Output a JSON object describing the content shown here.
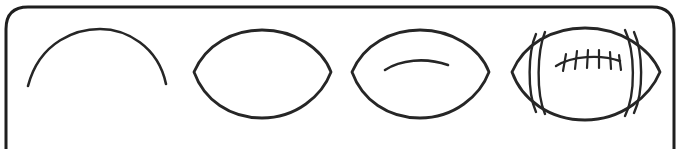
{
  "canvas": {
    "width": 681,
    "height": 149,
    "background_color": "#ffffff",
    "ink_color": "#262626",
    "frame_color": "#1f1f1f",
    "title": "How to draw a football - 4 step sequence"
  },
  "frame": {
    "shape": "rounded-rectangle",
    "corner_radius": 22,
    "stroke_width": 3,
    "x": 6,
    "y": 7,
    "width": 668,
    "height": 160,
    "note": "bottom edge cropped off below the visible canvas"
  },
  "steps": [
    {
      "index": 1,
      "name": "top-arc",
      "description": "single upward arc forming the top half of the football outline",
      "stroke_width": 2.6,
      "paths": [
        "M 28 86 C 40 40, 78 29, 100 29 C 126 29, 158 46, 166 84"
      ]
    },
    {
      "index": 2,
      "name": "lens-outline",
      "description": "closed lens (pointed oval) shape - the complete football outline",
      "stroke_width": 2.8,
      "paths": [
        "M 194 72 C 206 44, 234 30, 262 30 C 294 30, 322 48, 331 72 C 322 96, 296 118, 262 118 C 230 118, 204 100, 194 72 Z"
      ]
    },
    {
      "index": 3,
      "name": "lens-with-lace-line",
      "description": "lens outline plus a shallow inner arc marking the lace line",
      "stroke_width": 2.8,
      "paths": [
        "M 352 72 C 364 44, 392 30, 420 30 C 452 30, 480 48, 489 72 C 480 96, 454 118, 420 118 C 388 118, 362 100, 352 72 Z"
      ],
      "detail_paths": [
        "M 385 70 C 400 60, 425 57, 448 65"
      ]
    },
    {
      "index": 4,
      "name": "finished-football",
      "description": "finished football with two end stripe bands and laces with stitches",
      "stroke_width": 2.8,
      "paths": [
        "M 512 72 C 524 44, 552 28, 585 28 C 620 28, 650 48, 660 72 C 650 96, 622 120, 585 120 C 550 120, 522 100, 512 72 Z"
      ],
      "stripe_paths": [
        "M 536 34 C 528 52, 527 92, 536 112",
        "M 545 32 C 537 52, 536 93, 545 114",
        "M 634 32 C 643 52, 644 92, 634 113",
        "M 625 30 C 635 51, 636 94, 625 116"
      ],
      "lace_line_path": "M 556 66 C 572 56, 600 54, 620 61",
      "stitch_count": 6,
      "stitch_paths": [
        "M 566 54 L 563 71",
        "M 577 51 L 575 69",
        "M 588 50 L 587 68",
        "M 599 50 L 599 68",
        "M 610 52 L 611 69",
        "M 619 55 L 621 70"
      ]
    }
  ]
}
